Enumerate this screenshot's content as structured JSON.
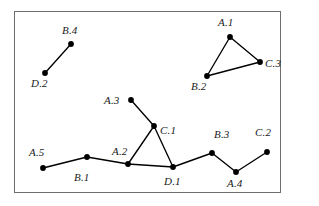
{
  "figure": {
    "background_color": "#ffffff",
    "frame_color": "#6e6e6e",
    "node_color": "#000000",
    "edge_color": "#000000",
    "frame": {
      "x": 14,
      "y": 11,
      "width": 267,
      "height": 182
    }
  },
  "chart_data": {
    "type": "scatter",
    "title": "",
    "xlabel": "",
    "ylabel": "",
    "grid": false,
    "legend": "none",
    "nodes": [
      {
        "id": "B.4",
        "label": "B.4",
        "x": 71,
        "y": 44,
        "label_x": 62,
        "label_y": 25
      },
      {
        "id": "D.2",
        "label": "D.2",
        "x": 45,
        "y": 73,
        "label_x": 31,
        "label_y": 78
      },
      {
        "id": "A.1",
        "label": "A.1",
        "x": 230,
        "y": 37,
        "label_x": 218,
        "label_y": 17
      },
      {
        "id": "C.3",
        "label": "C.3",
        "x": 260,
        "y": 62,
        "label_x": 265,
        "label_y": 58
      },
      {
        "id": "B.2",
        "label": "B.2",
        "x": 207,
        "y": 76,
        "label_x": 191,
        "label_y": 81
      },
      {
        "id": "A.3",
        "label": "A.3",
        "x": 131,
        "y": 100,
        "label_x": 104,
        "label_y": 95
      },
      {
        "id": "C.1",
        "label": "C.1",
        "x": 154,
        "y": 126,
        "label_x": 160,
        "label_y": 125
      },
      {
        "id": "A.2",
        "label": "A.2",
        "x": 128,
        "y": 164,
        "label_x": 112,
        "label_y": 146
      },
      {
        "id": "D.1",
        "label": "D.1",
        "x": 173,
        "y": 167,
        "label_x": 164,
        "label_y": 176
      },
      {
        "id": "A.5",
        "label": "A.5",
        "x": 43,
        "y": 168,
        "label_x": 29,
        "label_y": 147
      },
      {
        "id": "B.1",
        "label": "B.1",
        "x": 87,
        "y": 157,
        "label_x": 74,
        "label_y": 172
      },
      {
        "id": "B.3",
        "label": "B.3",
        "x": 212,
        "y": 153,
        "label_x": 214,
        "label_y": 129
      },
      {
        "id": "A.4",
        "label": "A.4",
        "x": 236,
        "y": 172,
        "label_x": 227,
        "label_y": 178
      },
      {
        "id": "C.2",
        "label": "C.2",
        "x": 267,
        "y": 152,
        "label_x": 255,
        "label_y": 127
      }
    ],
    "edges": [
      {
        "from": "D.2",
        "to": "B.4"
      },
      {
        "from": "A.1",
        "to": "B.2"
      },
      {
        "from": "A.1",
        "to": "C.3"
      },
      {
        "from": "B.2",
        "to": "C.3"
      },
      {
        "from": "A.3",
        "to": "C.1"
      },
      {
        "from": "C.1",
        "to": "A.2"
      },
      {
        "from": "C.1",
        "to": "D.1"
      },
      {
        "from": "A.5",
        "to": "B.1"
      },
      {
        "from": "B.1",
        "to": "A.2"
      },
      {
        "from": "A.2",
        "to": "D.1"
      },
      {
        "from": "D.1",
        "to": "B.3"
      },
      {
        "from": "B.3",
        "to": "A.4"
      },
      {
        "from": "A.4",
        "to": "C.2"
      }
    ],
    "node_radius": 2.9
  }
}
